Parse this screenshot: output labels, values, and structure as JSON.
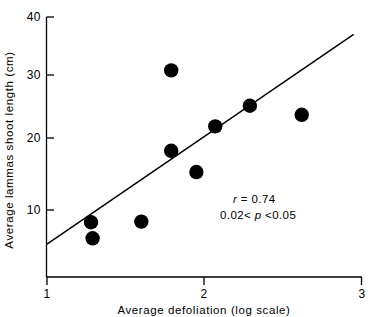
{
  "chart_data": {
    "type": "scatter",
    "title": "",
    "xlabel": "Average defoliation (log scale)",
    "ylabel": "Average lammas shoot length (cm)",
    "xlim": [
      1,
      3
    ],
    "ylim": [
      0,
      40
    ],
    "xticks": [
      "1",
      "2",
      "3"
    ],
    "xtick_values": [
      1,
      2,
      3
    ],
    "yticks": [
      "10",
      "20",
      "30",
      "40"
    ],
    "ytick_values": [
      10,
      20,
      30,
      40
    ],
    "grid": false,
    "legend": "none",
    "points": [
      {
        "x": 1.28,
        "y": 8.1
      },
      {
        "x": 1.29,
        "y": 5.6
      },
      {
        "x": 1.6,
        "y": 8.2
      },
      {
        "x": 1.79,
        "y": 31.7
      },
      {
        "x": 1.79,
        "y": 19.2
      },
      {
        "x": 1.95,
        "y": 15.9
      },
      {
        "x": 2.07,
        "y": 23.0
      },
      {
        "x": 2.29,
        "y": 26.2
      },
      {
        "x": 2.62,
        "y": 24.8
      }
    ],
    "fit_line": {
      "x_start": 1.0,
      "y_start": 4.7,
      "x_end": 2.95,
      "y_end": 37.3,
      "style": "solid"
    },
    "annotations": [
      {
        "name": "correlation",
        "text_italic": "r",
        "text": " = 0.74"
      },
      {
        "name": "p-value",
        "text_pre": "0.02< ",
        "text_italic": "p",
        "text_post": " <0.05"
      }
    ],
    "annotation_lines": [
      "r = 0.74",
      "0.02< p <0.05"
    ],
    "marker": {
      "shape": "circle",
      "color": "#000000",
      "size": 7.2
    },
    "line_color": "#000000",
    "axis_color": "#000000",
    "background": "#ffffff"
  }
}
